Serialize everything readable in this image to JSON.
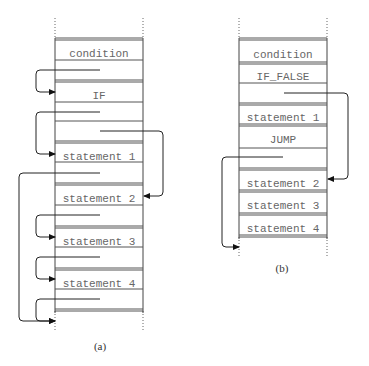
{
  "diagram": {
    "panels": [
      {
        "id": "a",
        "caption": "(a)",
        "caption_pos": [
          100,
          350
        ],
        "x_left": 55,
        "x_right": 143,
        "dotted_top": [
          18,
          38
        ],
        "dotted_bottom": [
          311,
          332
        ],
        "double_lines": [
          38,
          80,
          141,
          183,
          226,
          268,
          309
        ],
        "single_lines": [
          60,
          102,
          121,
          162,
          205,
          247,
          289
        ],
        "labels": [
          {
            "text": "condition",
            "y": 53
          },
          {
            "text": "IF",
            "y": 95
          },
          {
            "text": "statement 1",
            "y": 156
          },
          {
            "text": "statement 2",
            "y": 198
          },
          {
            "text": "statement 3",
            "y": 241
          },
          {
            "text": "statement 4",
            "y": 283
          }
        ],
        "edges": [
          {
            "points": [
              [
                100,
                70
              ],
              [
                36,
                70
              ],
              [
                36,
                92
              ],
              [
                55,
                92
              ]
            ],
            "arrow": "right"
          },
          {
            "points": [
              [
                100,
                112
              ],
              [
                36,
                112
              ],
              [
                36,
                154
              ],
              [
                55,
                154
              ]
            ],
            "arrow": "right"
          },
          {
            "points": [
              [
                100,
                131
              ],
              [
                163,
                131
              ],
              [
                163,
                196
              ],
              [
                144,
                196
              ]
            ],
            "arrow": "left"
          },
          {
            "points": [
              [
                100,
                173
              ],
              [
                19,
                173
              ],
              [
                19,
                321
              ],
              [
                55,
                321
              ]
            ],
            "arrow": "right"
          },
          {
            "points": [
              [
                100,
                215
              ],
              [
                36,
                215
              ],
              [
                36,
                237
              ],
              [
                55,
                237
              ]
            ],
            "arrow": "right"
          },
          {
            "points": [
              [
                100,
                257
              ],
              [
                36,
                257
              ],
              [
                36,
                279
              ],
              [
                55,
                279
              ]
            ],
            "arrow": "right"
          },
          {
            "points": [
              [
                100,
                299
              ],
              [
                36,
                299
              ],
              [
                36,
                321
              ],
              [
                55,
                321
              ]
            ],
            "arrow": "right"
          }
        ]
      },
      {
        "id": "b",
        "caption": "(b)",
        "caption_pos": [
          282,
          272
        ],
        "x_left": 239,
        "x_right": 327,
        "dotted_top": [
          18,
          38
        ],
        "dotted_bottom": [
          237,
          257
        ],
        "double_lines": [
          38,
          62,
          103,
          124,
          168,
          190,
          213,
          235
        ],
        "single_lines": [
          83,
          148
        ],
        "labels": [
          {
            "text": "condition",
            "y": 54
          },
          {
            "text": "IF_FALSE",
            "y": 76
          },
          {
            "text": "statement 1",
            "y": 117
          },
          {
            "text": "JUMP",
            "y": 139
          },
          {
            "text": "statement 2",
            "y": 183
          },
          {
            "text": "statement 3",
            "y": 205
          },
          {
            "text": "statement 4",
            "y": 228
          }
        ],
        "edges": [
          {
            "points": [
              [
                284,
                93
              ],
              [
                348,
                93
              ],
              [
                348,
                179
              ],
              [
                328,
                179
              ]
            ],
            "arrow": "left"
          },
          {
            "points": [
              [
                283,
                157
              ],
              [
                222,
                157
              ],
              [
                222,
                247
              ],
              [
                239,
                247
              ]
            ],
            "arrow": "right"
          }
        ]
      }
    ]
  }
}
